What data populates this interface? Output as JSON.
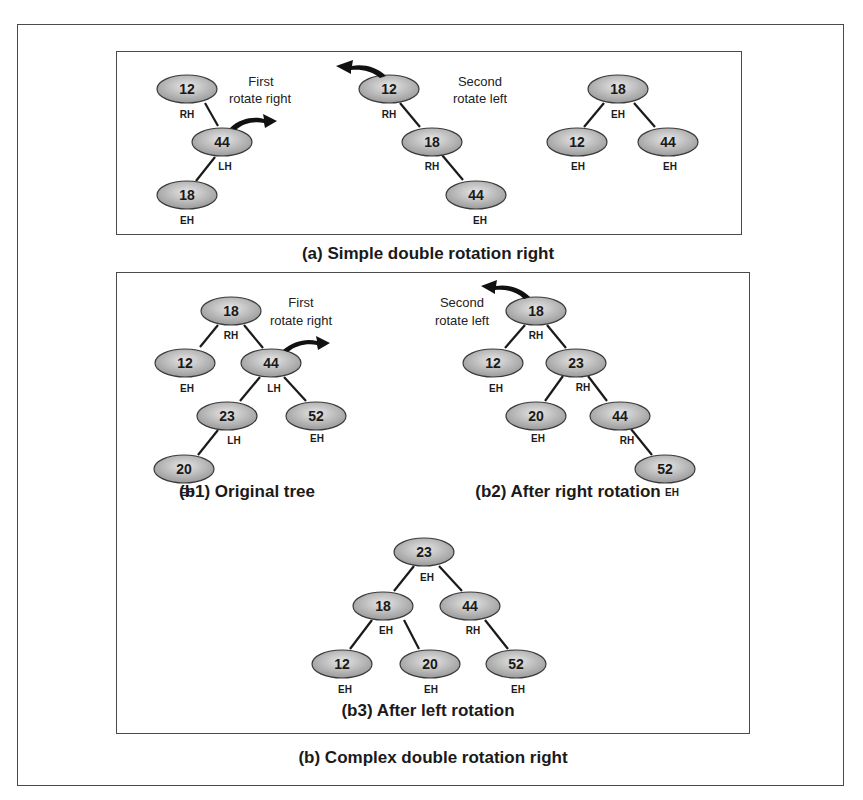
{
  "colors": {
    "node_fill_light": "#e2e2e2",
    "node_fill_dark": "#9a9a9a",
    "node_stroke": "#3a3a3a",
    "edge": "#1a1a1a",
    "frame": "#4a4a4a",
    "arrow": "#111111"
  },
  "panel_a": {
    "caption": "(a) Simple double rotation right",
    "step1": {
      "note_line1": "First",
      "note_line2": "rotate right",
      "nodes": [
        {
          "key": "12",
          "balance": "RH"
        },
        {
          "key": "44",
          "balance": "LH"
        },
        {
          "key": "18",
          "balance": "EH"
        }
      ]
    },
    "step2": {
      "note_line1": "Second",
      "note_line2": "rotate left",
      "nodes": [
        {
          "key": "12",
          "balance": "RH"
        },
        {
          "key": "18",
          "balance": "RH"
        },
        {
          "key": "44",
          "balance": "EH"
        }
      ]
    },
    "step3": {
      "nodes": [
        {
          "key": "18",
          "balance": "EH"
        },
        {
          "key": "12",
          "balance": "EH"
        },
        {
          "key": "44",
          "balance": "EH"
        }
      ]
    }
  },
  "panel_b": {
    "caption": "(b) Complex double rotation right",
    "b1": {
      "caption": "(b1) Original tree",
      "note_line1": "First",
      "note_line2": "rotate right",
      "nodes": [
        {
          "key": "18",
          "balance": "RH"
        },
        {
          "key": "12",
          "balance": "EH"
        },
        {
          "key": "44",
          "balance": "LH"
        },
        {
          "key": "23",
          "balance": "LH"
        },
        {
          "key": "52",
          "balance": "EH"
        },
        {
          "key": "20",
          "balance": "EH"
        }
      ]
    },
    "b2": {
      "caption": "(b2) After right rotation",
      "note_line1": "Second",
      "note_line2": "rotate left",
      "nodes": [
        {
          "key": "18",
          "balance": "RH"
        },
        {
          "key": "12",
          "balance": "EH"
        },
        {
          "key": "23",
          "balance": "RH"
        },
        {
          "key": "20",
          "balance": "EH"
        },
        {
          "key": "44",
          "balance": "RH"
        },
        {
          "key": "52",
          "balance": "EH"
        }
      ]
    },
    "b3": {
      "caption": "(b3) After left rotation",
      "nodes": [
        {
          "key": "23",
          "balance": "EH"
        },
        {
          "key": "18",
          "balance": "EH"
        },
        {
          "key": "44",
          "balance": "RH"
        },
        {
          "key": "12",
          "balance": "EH"
        },
        {
          "key": "20",
          "balance": "EH"
        },
        {
          "key": "52",
          "balance": "EH"
        }
      ]
    }
  }
}
